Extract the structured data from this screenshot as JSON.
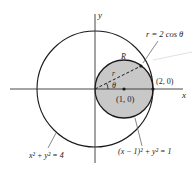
{
  "diagram": {
    "axes": {
      "x_label": "x",
      "y_label": "y"
    },
    "curves": {
      "outer_circle": {
        "equation": "x² + y² = 4"
      },
      "inner_circle": {
        "equation": "(x − 1)² + y² = 1"
      },
      "polar_curve": {
        "equation": "r = 2 cos θ"
      }
    },
    "region_label": "R",
    "radius_label": "r",
    "angle_label": "θ",
    "points": {
      "center": "(1, 0)",
      "rightmost": "(2, 0)"
    },
    "colors": {
      "region_fill": "#c8c8c8",
      "stroke": "#1a1a1a",
      "leader_line": "#888888"
    }
  }
}
